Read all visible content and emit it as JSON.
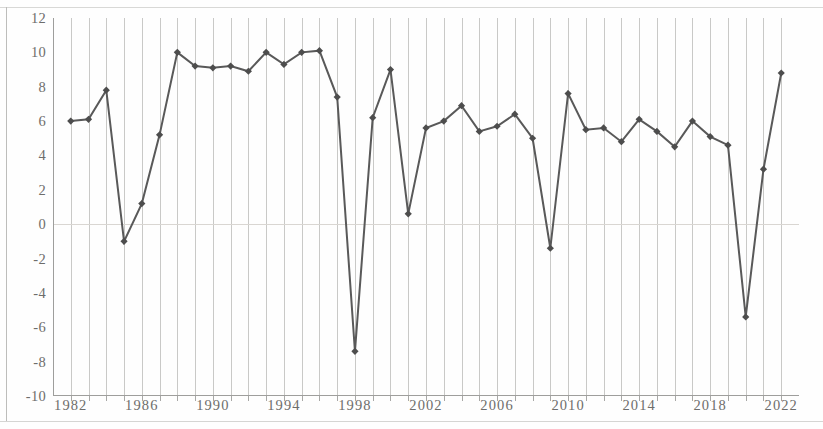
{
  "chart_data": {
    "type": "line",
    "title": "",
    "subtitle": "",
    "xlabel": "",
    "ylabel": "",
    "grid": "vertical",
    "legend": "none",
    "xlim": [
      1981,
      2023
    ],
    "ylim": [
      -10,
      12
    ],
    "y_tick_step": 2,
    "x_tick_step": 1,
    "x_label_step": 4,
    "y_ticks": [
      12,
      10,
      8,
      6,
      4,
      2,
      0,
      -2,
      -4,
      -6,
      -8,
      -10
    ],
    "y_tick_labels": [
      "12",
      "10",
      "8",
      "6",
      "4",
      "2",
      "0",
      "-2",
      "-4",
      "-6",
      "-8",
      "-10"
    ],
    "x_tick_labels": [
      "1982",
      "1986",
      "1990",
      "1994",
      "1998",
      "2002",
      "2006",
      "2010",
      "2014",
      "2018",
      "2022"
    ],
    "x": [
      1982,
      1983,
      1984,
      1985,
      1986,
      1987,
      1988,
      1989,
      1990,
      1991,
      1992,
      1993,
      1994,
      1995,
      1996,
      1997,
      1998,
      1999,
      2000,
      2001,
      2002,
      2003,
      2004,
      2005,
      2006,
      2007,
      2008,
      2009,
      2010,
      2011,
      2012,
      2013,
      2014,
      2015,
      2016,
      2017,
      2018,
      2019,
      2020,
      2021,
      2022
    ],
    "categories": [
      "1982",
      "1983",
      "1984",
      "1985",
      "1986",
      "1987",
      "1988",
      "1989",
      "1990",
      "1991",
      "1992",
      "1993",
      "1994",
      "1995",
      "1996",
      "1997",
      "1998",
      "1999",
      "2000",
      "2001",
      "2002",
      "2003",
      "2004",
      "2005",
      "2006",
      "2007",
      "2008",
      "2009",
      "2010",
      "2011",
      "2012",
      "2013",
      "2014",
      "2015",
      "2016",
      "2017",
      "2018",
      "2019",
      "2020",
      "2021",
      "2022"
    ],
    "values": [
      6.0,
      6.1,
      7.8,
      -1.0,
      1.2,
      5.2,
      10.0,
      9.2,
      9.1,
      9.2,
      8.9,
      10.0,
      9.3,
      10.0,
      10.1,
      7.4,
      -7.4,
      6.2,
      9.0,
      0.6,
      5.6,
      6.0,
      6.9,
      5.4,
      5.7,
      6.4,
      5.0,
      -1.4,
      7.6,
      5.5,
      5.6,
      4.8,
      6.1,
      5.4,
      4.5,
      6.0,
      5.1,
      4.6,
      -5.4,
      3.2,
      8.8
    ],
    "series": [
      {
        "name": "series-1",
        "values": [
          6.0,
          6.1,
          7.8,
          -1.0,
          1.2,
          5.2,
          10.0,
          9.2,
          9.1,
          9.2,
          8.9,
          10.0,
          9.3,
          10.0,
          10.1,
          7.4,
          -7.4,
          6.2,
          9.0,
          0.6,
          5.6,
          6.0,
          6.9,
          5.4,
          5.7,
          6.4,
          5.0,
          -1.4,
          7.6,
          5.5,
          5.6,
          4.8,
          6.1,
          5.4,
          4.5,
          6.0,
          5.1,
          4.6,
          -5.4,
          3.2,
          8.8
        ],
        "line_color": "#595959",
        "marker": "diamond",
        "marker_color": "#4d4d4d"
      }
    ],
    "colors": {
      "line": "#595959",
      "marker": "#4d4d4d",
      "gridline": "#c9c9c7",
      "axis": "#9e9e9c",
      "zero_line": "#d9d6d2",
      "tick_text": "#6d6d6b",
      "background": "#fefefe"
    }
  }
}
